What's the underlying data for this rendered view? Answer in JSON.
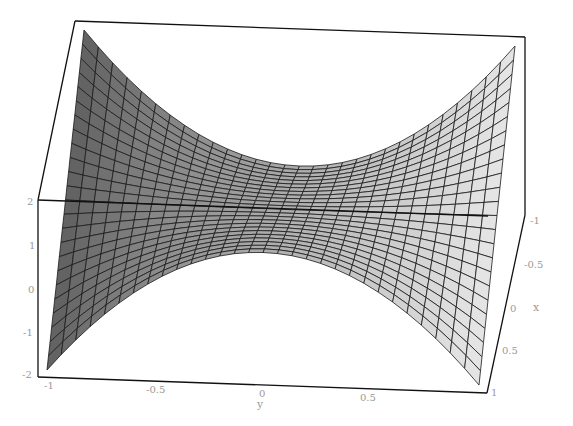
{
  "chart_data": {
    "type": "surface3d",
    "title": "",
    "function": "z = 2*(x^2 - y^2) (hyperbolic paraboloid / saddle)",
    "x": {
      "label": "x",
      "range": [
        -1,
        1
      ],
      "ticks": [
        "-1",
        "-0.5",
        "0",
        "0.5",
        "1"
      ]
    },
    "y": {
      "label": "y",
      "range": [
        -1,
        1
      ],
      "ticks": [
        "-1",
        "-0.5",
        "0",
        "0.5",
        "1"
      ]
    },
    "z": {
      "label": "",
      "range": [
        -2,
        2
      ],
      "ticks": [
        "2",
        "1",
        "0",
        "-1",
        "-2"
      ]
    },
    "mesh": {
      "rows": 24,
      "cols": 30
    },
    "shading": {
      "left_color": "#5e5e5e",
      "right_color": "#e6e6e6",
      "line_color": "#1a1a1a"
    },
    "box_visible": true,
    "grid": false,
    "legend": null
  },
  "labels": {
    "z_ticks": [
      {
        "text": "2",
        "x": 27,
        "y": 197
      },
      {
        "text": "1",
        "x": 29,
        "y": 241
      },
      {
        "text": "0",
        "x": 28,
        "y": 285
      },
      {
        "text": "-1",
        "x": 23,
        "y": 328
      },
      {
        "text": "-2",
        "x": 22,
        "y": 370
      }
    ],
    "y_ticks": [
      {
        "text": "-1",
        "x": 44,
        "y": 381
      },
      {
        "text": "-0.5",
        "x": 146,
        "y": 385
      },
      {
        "text": "0",
        "x": 259,
        "y": 389
      },
      {
        "text": "0.5",
        "x": 360,
        "y": 393
      },
      {
        "text": "1",
        "x": 491,
        "y": 388
      }
    ],
    "x_ticks": [
      {
        "text": "-1",
        "x": 530,
        "y": 216
      },
      {
        "text": "-0.5",
        "x": 524,
        "y": 260
      },
      {
        "text": "0",
        "x": 510,
        "y": 304
      },
      {
        "text": "0.5",
        "x": 502,
        "y": 346
      },
      {
        "text": "1",
        "x": 491,
        "y": 388
      }
    ],
    "y_title": {
      "text": "y",
      "x": 257,
      "y": 399
    },
    "x_title": {
      "text": "x",
      "x": 533,
      "y": 302
    }
  },
  "geometry": {
    "box": {
      "back_top_left": [
        75,
        21
      ],
      "back_top_right": [
        525,
        37
      ],
      "front_top_left": [
        38,
        200
      ],
      "front_top_right": [
        488,
        216
      ],
      "front_bottom_left": [
        38,
        377
      ],
      "front_bottom_right": [
        487,
        393
      ],
      "right_mid": [
        525,
        215
      ]
    },
    "surface": {
      "top_left": [
        84,
        30
      ],
      "top_right": [
        515,
        46
      ],
      "bottom_left": [
        47,
        370
      ],
      "bottom_right": [
        479,
        385
      ],
      "top_sag": 128,
      "bottom_arch": 125
    }
  }
}
